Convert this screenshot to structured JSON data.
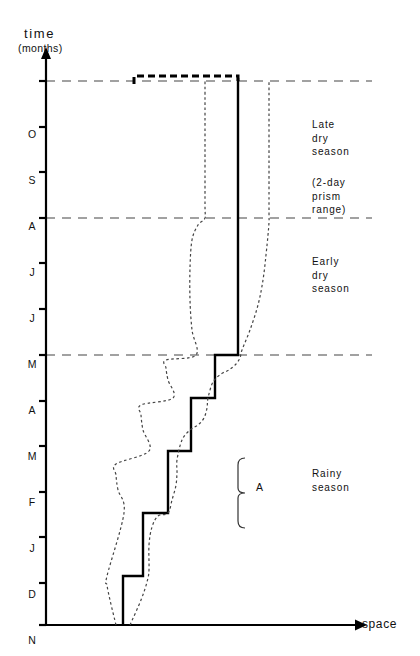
{
  "figure": {
    "width": 420,
    "height": 656,
    "background": "#ffffff",
    "ink": "#000000"
  },
  "axes": {
    "y_title": "time",
    "y_subtitle": "(months)",
    "x_title": "space",
    "y_axis_x": 46,
    "x_axis_y": 625,
    "y_axis_top": 57,
    "x_axis_right": 355
  },
  "month_labels": [
    "O",
    "S",
    "A",
    "J",
    "J",
    "M",
    "A",
    "M",
    "F",
    "J",
    "D",
    "N"
  ],
  "month_label_y": [
    134,
    180,
    226,
    272,
    318,
    364,
    410,
    456,
    502,
    548,
    594,
    640
  ],
  "tick_y": [
    81,
    127,
    172,
    218,
    263,
    309,
    355,
    401,
    446,
    492,
    537,
    583,
    625
  ],
  "season_bands": [
    {
      "key": "late_dry",
      "label": "Late\ndry\nseason",
      "note": "(2-day\nprism\nrange)",
      "y": 118,
      "note_y": 176
    },
    {
      "key": "early_dry",
      "label": "Early\ndry\nseason",
      "y": 255
    },
    {
      "key": "rainy",
      "label": "Rainy\nseason",
      "y": 467
    }
  ],
  "reference_lines_y": [
    81,
    218,
    355
  ],
  "annotation": {
    "brace_label": "A",
    "brace_top": 458,
    "brace_bottom": 528,
    "brace_x": 238,
    "label_x": 256,
    "label_y": 487
  },
  "chart_data": {
    "type": "line",
    "title": "",
    "xlabel": "space",
    "ylabel": "time (months)",
    "ytick_labels": [
      "O",
      "S",
      "A",
      "J",
      "J",
      "M",
      "A",
      "M",
      "F",
      "J",
      "D",
      "N"
    ],
    "grid": false,
    "legend": null,
    "series": [
      {
        "name": "mean prism trajectory (solid staircase)",
        "style": "solid",
        "linewidth": 2.4,
        "points": [
          [
            123,
            625
          ],
          [
            123,
            576
          ],
          [
            143,
            576
          ],
          [
            143,
            576
          ],
          [
            143,
            576
          ],
          [
            143,
            513
          ],
          [
            168,
            513
          ],
          [
            168,
            513
          ],
          [
            168,
            451
          ],
          [
            191,
            451
          ],
          [
            191,
            451
          ],
          [
            191,
            398
          ],
          [
            215,
            398
          ],
          [
            215,
            398
          ],
          [
            215,
            355
          ],
          [
            238,
            355
          ],
          [
            238,
            355
          ],
          [
            238,
            78
          ]
        ]
      },
      {
        "name": "upper envelope at late dry season (heavy dashed cap)",
        "style": "heavy-dashed",
        "linewidth": 3.0,
        "points": [
          [
            134,
            84
          ],
          [
            134,
            76
          ],
          [
            238,
            76
          ],
          [
            238,
            84
          ]
        ]
      },
      {
        "name": "left dispersion envelope (dotted)",
        "style": "dotted",
        "linewidth": 1.2,
        "points": [
          [
            116,
            625
          ],
          [
            110,
            600
          ],
          [
            107,
            585
          ],
          [
            107,
            576
          ],
          [
            124,
            513
          ],
          [
            118,
            490
          ],
          [
            116,
            475
          ],
          [
            116,
            464
          ],
          [
            149,
            451
          ],
          [
            143,
            430
          ],
          [
            141,
            415
          ],
          [
            141,
            405
          ],
          [
            173,
            398
          ],
          [
            168,
            380
          ],
          [
            166,
            368
          ],
          [
            166,
            360
          ],
          [
            196,
            355
          ],
          [
            192,
            330
          ],
          [
            190,
            300
          ],
          [
            190,
            268
          ],
          [
            192,
            240
          ],
          [
            198,
            225
          ],
          [
            205,
            218
          ],
          [
            205,
            205
          ],
          [
            205,
            130
          ],
          [
            205,
            88
          ],
          [
            205,
            80
          ]
        ]
      },
      {
        "name": "right dispersion envelope (dotted)",
        "style": "dotted",
        "linewidth": 1.2,
        "points": [
          [
            130,
            625
          ],
          [
            141,
            600
          ],
          [
            147,
            582
          ],
          [
            149,
            570
          ],
          [
            149,
            545
          ],
          [
            152,
            527
          ],
          [
            158,
            516
          ],
          [
            168,
            513
          ],
          [
            172,
            500
          ],
          [
            176,
            485
          ],
          [
            177,
            472
          ],
          [
            177,
            460
          ],
          [
            182,
            440
          ],
          [
            190,
            430
          ],
          [
            198,
            425
          ],
          [
            204,
            418
          ],
          [
            207,
            408
          ],
          [
            208,
            398
          ],
          [
            213,
            382
          ],
          [
            221,
            374
          ],
          [
            229,
            370
          ],
          [
            236,
            364
          ],
          [
            240,
            358
          ],
          [
            242,
            350
          ],
          [
            250,
            330
          ],
          [
            258,
            305
          ],
          [
            263,
            280
          ],
          [
            266,
            255
          ],
          [
            268,
            235
          ],
          [
            269,
            222
          ],
          [
            269,
            210
          ],
          [
            269,
            160
          ],
          [
            269,
            110
          ],
          [
            269,
            80
          ]
        ]
      }
    ]
  }
}
